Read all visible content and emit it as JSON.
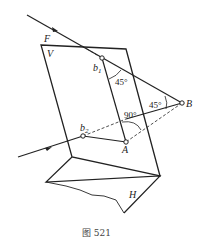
{
  "figure": {
    "caption": "图 521",
    "labels": {
      "F": "F",
      "V": "V",
      "b1": "b",
      "b1_sub": "1",
      "b2": "b",
      "b2_sub": "2",
      "A": "A",
      "B": "B",
      "H": "H"
    },
    "angles": {
      "angle_b1": "45°",
      "angle_B": "45°",
      "angle_A": "90°"
    }
  }
}
